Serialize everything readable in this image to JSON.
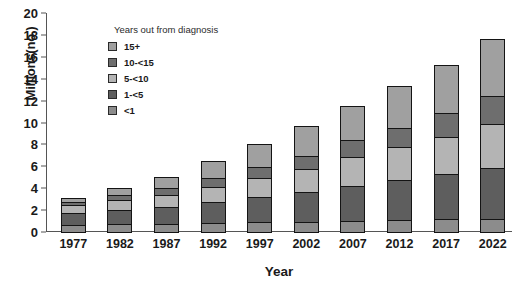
{
  "chart_data": {
    "type": "bar",
    "title": "",
    "xlabel": "Year",
    "ylabel": "Millions(no.)",
    "ylim": [
      0,
      20
    ],
    "yticks": [
      0,
      2,
      4,
      6,
      8,
      10,
      12,
      14,
      16,
      18,
      20
    ],
    "grid": false,
    "stacked": true,
    "legend_title": "Years out from diagnosis",
    "legend_position": "top-left inside plot",
    "categories": [
      "1977",
      "1982",
      "1987",
      "1992",
      "1997",
      "2002",
      "2007",
      "2012",
      "2017",
      "2022"
    ],
    "series": [
      {
        "name": "<1",
        "color": "#8c8c8c",
        "values": [
          0.75,
          0.8,
          0.85,
          0.9,
          1.0,
          1.05,
          1.1,
          1.2,
          1.25,
          1.3
        ]
      },
      {
        "name": "1-<5",
        "color": "#5e5e5e",
        "values": [
          1.15,
          1.4,
          1.65,
          2.0,
          2.4,
          2.75,
          3.3,
          3.7,
          4.2,
          4.7
        ]
      },
      {
        "name": "5-<10",
        "color": "#b4b4b4",
        "values": [
          0.85,
          1.0,
          1.2,
          1.5,
          1.8,
          2.2,
          2.7,
          3.1,
          3.5,
          4.1
        ]
      },
      {
        "name": "10-<15",
        "color": "#6e6e6e",
        "values": [
          0.4,
          0.55,
          0.7,
          0.9,
          1.1,
          1.35,
          1.65,
          1.9,
          2.3,
          2.7
        ]
      },
      {
        "name": "15+",
        "color": "#a0a0a0",
        "values": [
          0.45,
          0.75,
          1.1,
          1.6,
          2.2,
          2.75,
          3.25,
          3.9,
          4.45,
          5.3
        ]
      }
    ],
    "totals": [
      3.6,
      4.5,
      5.5,
      6.9,
      8.5,
      10.1,
      12.0,
      13.8,
      15.7,
      18.1
    ],
    "stack_order_bottom_to_top": [
      "<1",
      "1-<5",
      "5-<10",
      "10-<15",
      "15+"
    ],
    "legend_order_top_to_bottom": [
      "15+",
      "10-<15",
      "5-<10",
      "1-<5",
      "<1"
    ]
  }
}
